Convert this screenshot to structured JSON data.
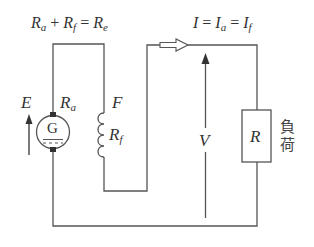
{
  "diagram": {
    "colors": {
      "wire": "#555555",
      "text": "#333333",
      "background": "#ffffff"
    },
    "equations": {
      "resistance": {
        "lhs1": "R",
        "lhs1_sub": "a",
        "plus": "+",
        "lhs2": "R",
        "lhs2_sub": "f",
        "eq": "=",
        "rhs": "R",
        "rhs_sub": "e"
      },
      "current": {
        "lhs": "I",
        "eq1": "=",
        "mid": "I",
        "mid_sub": "a",
        "eq2": "=",
        "rhs": "I",
        "rhs_sub": "f"
      }
    },
    "generator": {
      "emf_label": "E",
      "resistance_label": "R",
      "resistance_sub": "a",
      "symbol_letter": "G",
      "icon": "dc-generator-icon"
    },
    "field_winding": {
      "label": "F",
      "resistance_label": "R",
      "resistance_sub": "f",
      "icon": "inductor-coil-icon"
    },
    "voltage": {
      "label": "V"
    },
    "load": {
      "label": "R",
      "caption_line1": "負",
      "caption_line2": "荷",
      "icon": "resistor-icon"
    },
    "current_arrow": {
      "icon": "hollow-arrow-right-icon"
    }
  }
}
